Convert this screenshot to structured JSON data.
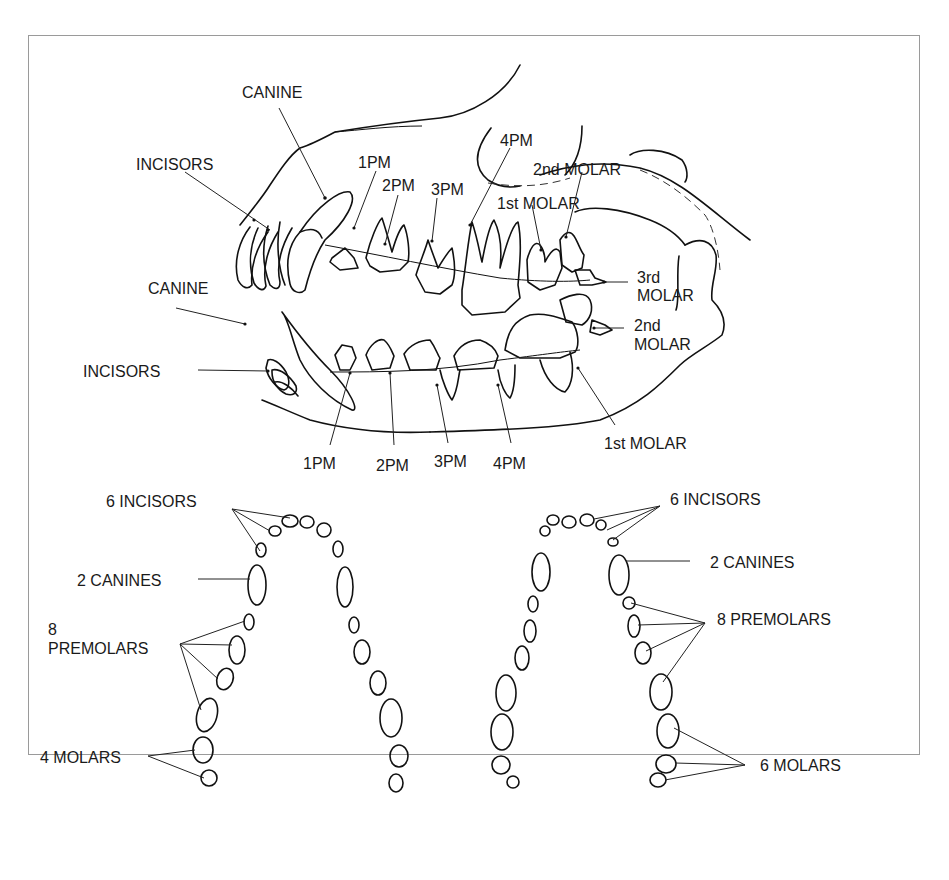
{
  "figure": {
    "lateral_view": {
      "upper_labels": [
        "CANINE",
        "INCISORS",
        "1PM",
        "2PM",
        "3PM",
        "4PM",
        "2nd MOLAR",
        "1st MOLAR",
        "3rd",
        "MOLAR",
        "2nd",
        "MOLAR"
      ],
      "lower_labels": [
        "CANINE",
        "INCISORS",
        "1PM",
        "2PM",
        "3PM",
        "4PM",
        "1st MOLAR"
      ]
    },
    "lower_arch": {
      "incisors": "6 INCISORS",
      "canines": "2 CANINES",
      "premolars_line1": "8",
      "premolars_line2": "PREMOLARS",
      "molars": "4 MOLARS"
    },
    "upper_arch": {
      "incisors": "6 INCISORS",
      "canines": "2 CANINES",
      "premolars": "8 PREMOLARS",
      "molars": "6 MOLARS"
    }
  }
}
